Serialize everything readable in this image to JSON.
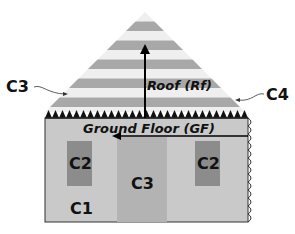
{
  "labels": {
    "roof": "Roof (Rf)",
    "ground_floor": "Ground Floor (GF)",
    "c3_left": "C3",
    "c4_right": "C4",
    "c2_left": "C2",
    "c2_right": "C2",
    "c3_center": "C3",
    "c1": "C1"
  },
  "colors": {
    "stripe_dark": "#a8a8a8",
    "stripe_light": "#efefef",
    "floor": "#c9c9c9",
    "c2": "#8c8c8c",
    "c3": "#b3b3b3"
  }
}
